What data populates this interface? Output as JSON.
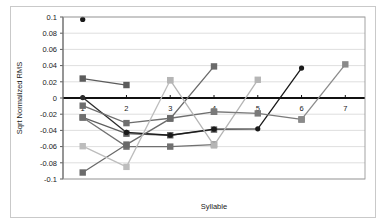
{
  "chart_data": {
    "type": "line",
    "title": "",
    "xlabel": "Syllable",
    "ylabel": "Sqrt Normalized RMS",
    "categories": [
      "1",
      "2",
      "3",
      "4",
      "5",
      "6",
      "7"
    ],
    "x": [
      1,
      2,
      3,
      4,
      5,
      6,
      7
    ],
    "xlim": [
      0.55,
      7.45
    ],
    "ylim": [
      -0.1,
      0.1
    ],
    "yticks": [
      -0.1,
      -0.08,
      -0.06,
      -0.04,
      -0.02,
      0,
      0.02,
      0.04,
      0.06,
      0.08,
      0.1
    ],
    "ytick_labels": [
      "-0.1",
      "-0.08",
      "-0.06",
      "-0.04",
      "-0.02",
      "0",
      "0.02",
      "0.04",
      "0.06",
      "0.08",
      "0.1"
    ],
    "grid": true,
    "grid_axis": "y",
    "legend": "none",
    "zero_line": true,
    "series": [
      {
        "name": "series-1-syllables-1",
        "color": "#1a1a1a",
        "marker": "circle",
        "x": [
          1
        ],
        "values": [
          0.097
        ]
      },
      {
        "name": "series-2-syllables-2",
        "color": "#5c5c5c",
        "marker": "square",
        "x": [
          1,
          2
        ],
        "values": [
          0.024,
          0.016
        ]
      },
      {
        "name": "series-3-syllables-2-dark",
        "color": "#2b2b2b",
        "marker": "circle",
        "x": [
          1,
          2
        ],
        "values": [
          0.0005,
          -0.0425
        ]
      },
      {
        "name": "series-4-syllables-3",
        "color": "#6e6e6e",
        "marker": "square",
        "x": [
          1,
          2,
          3,
          4
        ],
        "values": [
          -0.0095,
          -0.031,
          -0.025,
          -0.017
        ]
      },
      {
        "name": "series-5-syllables-4",
        "color": "#5f5f5f",
        "marker": "square",
        "x": [
          1,
          2,
          3,
          4
        ],
        "values": [
          -0.024,
          -0.044,
          -0.046,
          -0.039
        ]
      },
      {
        "name": "series-6-syllables-5-dark",
        "color": "#1a1a1a",
        "marker": "circle",
        "x": [
          2,
          3,
          4,
          5,
          6
        ],
        "values": [
          -0.0425,
          -0.046,
          -0.0385,
          -0.038,
          0.037
        ]
      },
      {
        "name": "series-7-syllables-5",
        "color": "#707070",
        "marker": "square",
        "x": [
          1,
          2,
          3,
          4
        ],
        "values": [
          -0.024,
          -0.06,
          -0.06,
          -0.0575
        ]
      },
      {
        "name": "series-8-rising-mid",
        "color": "#6a6a6a",
        "marker": "square",
        "x": [
          1,
          2,
          3,
          4
        ],
        "values": [
          -0.092,
          -0.0575,
          -0.0255,
          0.039
        ]
      },
      {
        "name": "series-9-light-rising",
        "color": "#bdbdbd",
        "marker": "square",
        "x": [
          1,
          2,
          3
        ],
        "values": [
          -0.0595,
          -0.085,
          0.022
        ]
      },
      {
        "name": "series-10-light-to-five",
        "color": "#b5b5b5",
        "marker": "square",
        "x": [
          3,
          4,
          5
        ],
        "values": [
          0.022,
          -0.0585,
          0.0225
        ]
      },
      {
        "name": "series-11-five-to-six",
        "color": "#7a7a7a",
        "marker": "square",
        "x": [
          4,
          5,
          6
        ],
        "values": [
          -0.017,
          -0.019,
          -0.0265
        ]
      },
      {
        "name": "series-12-six-to-seven",
        "color": "#8a8a8a",
        "marker": "square",
        "x": [
          6,
          7
        ],
        "values": [
          -0.0265,
          0.0415
        ]
      }
    ]
  }
}
